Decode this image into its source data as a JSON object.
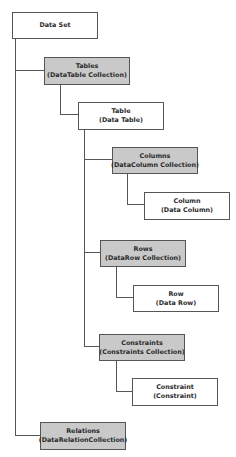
{
  "diagram": {
    "nodes": {
      "dataset": {
        "title": "Data Set",
        "subtitle": ""
      },
      "tables": {
        "title": "Tables",
        "subtitle": "(DataTable Collection)"
      },
      "table": {
        "title": "Table",
        "subtitle": "(Data Table)"
      },
      "columns": {
        "title": "Columns",
        "subtitle": "(DataColumn Collection)"
      },
      "column": {
        "title": "Column",
        "subtitle": "(Data Column)"
      },
      "rows": {
        "title": "Rows",
        "subtitle": "(DataRow Collection)"
      },
      "row": {
        "title": "Row",
        "subtitle": "(Data Row)"
      },
      "constraints": {
        "title": "Constraints",
        "subtitle": "(Constraints Collection)"
      },
      "constraint": {
        "title": "Constraint",
        "subtitle": "(Constraint)"
      },
      "relations": {
        "title": "Relations",
        "subtitle": "(DataRelationCollection)"
      }
    },
    "edges": [
      [
        "dataset",
        "tables"
      ],
      [
        "dataset",
        "relations"
      ],
      [
        "tables",
        "table"
      ],
      [
        "table",
        "columns"
      ],
      [
        "table",
        "rows"
      ],
      [
        "table",
        "constraints"
      ],
      [
        "columns",
        "column"
      ],
      [
        "rows",
        "row"
      ],
      [
        "constraints",
        "constraint"
      ]
    ],
    "colors": {
      "collection_fill": "#c9c9c9",
      "object_fill": "#ffffff",
      "border": "#555555"
    }
  }
}
